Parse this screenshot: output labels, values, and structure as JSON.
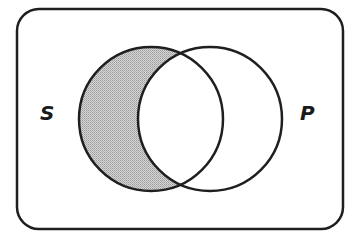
{
  "diagram": {
    "type": "venn",
    "sets": [
      {
        "id": "S",
        "label": "S",
        "shaded_region": "S-only (S minus P)"
      },
      {
        "id": "P",
        "label": "P"
      }
    ],
    "shaded": [
      "S only"
    ],
    "unshaded": [
      "S and P overlap",
      "P only",
      "outside"
    ],
    "colors": {
      "stroke": "#1f1f1f",
      "shade": "#c4c4c4",
      "background": "#ffffff"
    }
  }
}
